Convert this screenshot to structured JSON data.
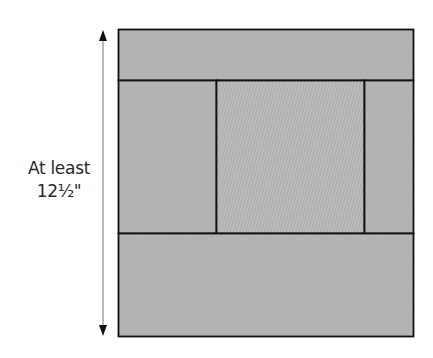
{
  "diagram": {
    "dimension_label": {
      "line1": "At least",
      "line2": "12½\""
    },
    "colors": {
      "fabric": "#b4b4b4",
      "center_fabric": "#b9b9b9",
      "seam": "#111111",
      "arrow_shaft": "#8a8a8a",
      "arrow_head": "#111111"
    },
    "pieces": [
      {
        "id": "top-strip",
        "role": "top border strip"
      },
      {
        "id": "left-strip",
        "role": "left side strip"
      },
      {
        "id": "center-square",
        "role": "center square"
      },
      {
        "id": "right-strip",
        "role": "right side strip"
      },
      {
        "id": "bottom-strip",
        "role": "bottom border strip"
      }
    ]
  }
}
